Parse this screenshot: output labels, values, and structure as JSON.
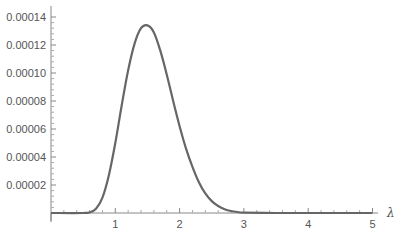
{
  "chart_data": {
    "type": "line",
    "title": "",
    "xlabel": "λ",
    "ylabel": "",
    "xlim": [
      0,
      5
    ],
    "ylim": [
      0,
      0.00014
    ],
    "grid": false,
    "legend": null,
    "x_ticks": [
      1,
      2,
      3,
      4,
      5
    ],
    "x_tick_labels": [
      "1",
      "2",
      "3",
      "4",
      "5"
    ],
    "y_ticks": [
      2e-05,
      4e-05,
      6e-05,
      8e-05,
      0.0001,
      0.00012,
      0.00014
    ],
    "y_tick_labels": [
      "0.00002",
      "0.00004",
      "0.00006",
      "0.00008",
      "0.00010",
      "0.00012",
      "0.00014"
    ],
    "line_color": "#666666",
    "series": [
      {
        "name": "curve",
        "x": [
          0,
          0.5,
          0.6,
          0.7,
          0.8,
          0.9,
          1.0,
          1.1,
          1.2,
          1.3,
          1.4,
          1.5,
          1.6,
          1.7,
          1.8,
          1.9,
          2.0,
          2.1,
          2.2,
          2.3,
          2.4,
          2.5,
          2.6,
          2.7,
          2.8,
          2.9,
          3.0,
          3.5,
          4.0,
          5.0
        ],
        "y": [
          0,
          0,
          5e-07,
          3e-06,
          1.1e-05,
          2.7e-05,
          5e-05,
          7.7e-05,
          0.000102,
          0.000121,
          0.000132,
          0.000134,
          0.000129,
          0.000116,
          9.9e-05,
          8e-05,
          6.2e-05,
          4.6e-05,
          3.3e-05,
          2.2e-05,
          1.4e-05,
          8.5e-06,
          5e-06,
          2.7e-06,
          1.4e-06,
          7e-07,
          3e-07,
          1e-08,
          0,
          0
        ]
      }
    ]
  }
}
